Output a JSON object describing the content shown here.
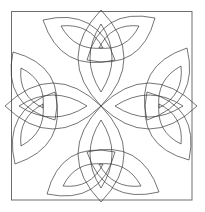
{
  "figure": {
    "colors": {
      "background": "#ffffff",
      "frame": "#6e6e6e",
      "lines": "#3a3a3a"
    },
    "frame": {
      "x": 11,
      "y": 11,
      "width": 181,
      "height": 189
    },
    "center": {
      "x": 101,
      "y": 106
    },
    "arms": [
      {
        "name": "top",
        "rotation": 0
      },
      {
        "name": "right",
        "rotation": 90
      },
      {
        "name": "bottom",
        "rotation": 180
      },
      {
        "name": "left",
        "rotation": 270
      }
    ]
  }
}
